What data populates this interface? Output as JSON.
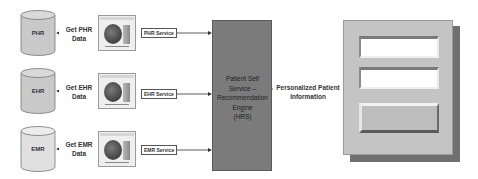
{
  "sources": [
    {
      "db_label": "PHR",
      "get_label_line1": "Get PHR",
      "get_label_line2": "Data",
      "service_label": "PHR Service"
    },
    {
      "db_label": "EHR",
      "get_label_line1": "Get EHR",
      "get_label_line2": "Data",
      "service_label": "EHR Service"
    },
    {
      "db_label": "EMR",
      "get_label_line1": "Get EMR",
      "get_label_line2": "Data",
      "service_label": "EMR Service"
    }
  ],
  "engine": {
    "line1": "Patient Self",
    "line2": "Service –",
    "line3": "Recommendation",
    "line4": "Engine",
    "line5": "(HRS)",
    "color": "#7b7b7b"
  },
  "output": {
    "line1": "Personalized Patient",
    "line2": "Information"
  },
  "portal": {
    "fields": [
      "input",
      "input",
      "button"
    ]
  }
}
